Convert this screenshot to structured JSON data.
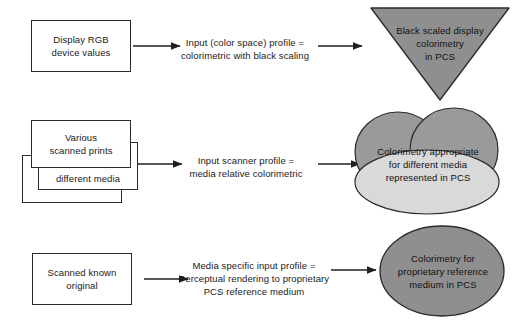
{
  "diagram": {
    "colors": {
      "outline": "#2b2b2b",
      "box_fill": "#ffffff",
      "shape_dark": "#8f8f8f",
      "shape_mid": "#9a9a9a",
      "shape_light": "#d9d9d9",
      "text": "#111111",
      "background": "#ffffff"
    },
    "rows": [
      {
        "id": "row-display",
        "source_box": {
          "label": "Display RGB\ndevice values"
        },
        "arrow_1": "arrow-right-icon",
        "caption": "Input (color space) profile =\ncolorimetric with black scaling",
        "arrow_2": "arrow-right-icon",
        "target_shape": {
          "kind": "triangle-down",
          "label": "Black scaled display\ncolorimetry\nin PCS"
        }
      },
      {
        "id": "row-scanner",
        "source_box": {
          "label": "Various\nscanned prints"
        },
        "source_box_2": {
          "label": "different media"
        },
        "source_box_3": {
          "label": ""
        },
        "arrow_1": "arrow-right-icon",
        "caption": "Input scanner profile =\nmedia relative colorimetric",
        "arrow_2": "arrow-right-icon",
        "target_shape": {
          "kind": "cloud",
          "label": "Colorimetry appropriate\nfor different media\nrepresented in PCS"
        }
      },
      {
        "id": "row-perceptual",
        "source_box": {
          "label": "Scanned known\noriginal"
        },
        "arrow_1": "arrow-right-icon",
        "caption": "Media specific input profile =\nPerceptual rendering to proprietary\nPCS reference medium",
        "arrow_2": "arrow-right-icon",
        "target_shape": {
          "kind": "ellipse",
          "label": "Colorimetry for\nproprietary reference\nmedium in PCS"
        }
      }
    ]
  }
}
